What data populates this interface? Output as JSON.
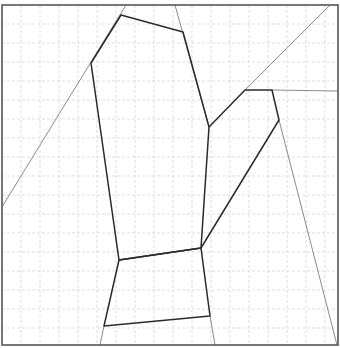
{
  "diagram": {
    "width": 340,
    "height": 348,
    "frame": {
      "x1": 2,
      "y1": 5,
      "x2": 338,
      "y2": 345
    },
    "grid": {
      "spacing": 19,
      "origin_x": 2,
      "origin_y": 5,
      "color": "#d4d4d4"
    },
    "colors": {
      "frame": "#555555",
      "thin": "#8a8a8a",
      "thick": "#2a2a2a",
      "background": "#ffffff"
    },
    "thin_lines": [
      {
        "name": "left-diagonal",
        "points": [
          [
            126,
            5
          ],
          [
            2,
            207
          ]
        ]
      },
      {
        "name": "top-right-slant",
        "points": [
          [
            175,
            5
          ],
          [
            209,
            127
          ]
        ]
      },
      {
        "name": "upper-right-diagonal",
        "points": [
          [
            245,
            90
          ],
          [
            330,
            5
          ]
        ]
      },
      {
        "name": "right-horizontal",
        "points": [
          [
            272,
            90
          ],
          [
            338,
            91
          ]
        ]
      },
      {
        "name": "right-long-slant",
        "points": [
          [
            279,
            120
          ],
          [
            337,
            345
          ]
        ]
      },
      {
        "name": "bottom-left-stub",
        "points": [
          [
            104,
            326
          ],
          [
            100,
            345
          ]
        ]
      },
      {
        "name": "bottom-right-stub",
        "points": [
          [
            210,
            316
          ],
          [
            215,
            345
          ]
        ]
      }
    ],
    "thick_paths": [
      {
        "name": "upper-polygon",
        "points": [
          [
            91,
            63
          ],
          [
            121,
            15
          ],
          [
            183,
            32
          ],
          [
            209,
            127
          ],
          [
            201,
            248
          ],
          [
            119,
            260
          ],
          [
            91,
            63
          ]
        ]
      },
      {
        "name": "right-arm",
        "points": [
          [
            209,
            127
          ],
          [
            245,
            90
          ],
          [
            272,
            90
          ],
          [
            279,
            120
          ],
          [
            201,
            248
          ]
        ]
      },
      {
        "name": "bottom-quad",
        "points": [
          [
            119,
            260
          ],
          [
            201,
            248
          ],
          [
            210,
            316
          ],
          [
            104,
            326
          ],
          [
            119,
            260
          ]
        ]
      }
    ]
  }
}
